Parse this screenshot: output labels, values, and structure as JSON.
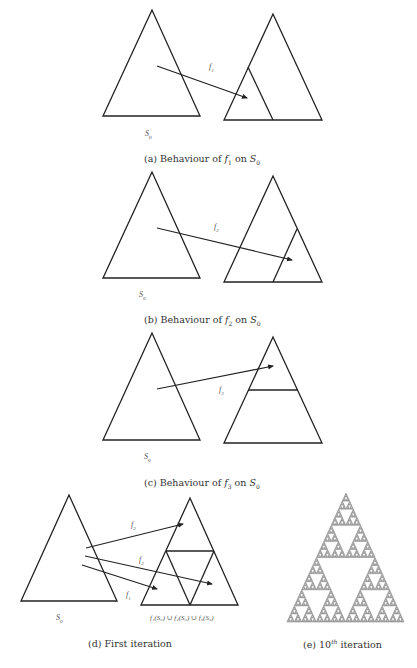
{
  "style": {
    "stroke": "#222222",
    "fractal_color": "#8a8a8a",
    "background": "#ffffff"
  },
  "panels": [
    {
      "id": "a",
      "caption": {
        "prefix": "(a) Behaviour of ",
        "fn": "f",
        "fn_sub": "1",
        "mid": " on ",
        "set": "S",
        "set_sub": "0",
        "x": 144,
        "y": 153
      },
      "source": {
        "apex": [
          152,
          10
        ],
        "left": [
          103,
          116
        ],
        "right": [
          200,
          116
        ]
      },
      "source_label": {
        "text": "S",
        "sub": "0",
        "x": 145,
        "y": 129
      },
      "target": {
        "apex": [
          273,
          14
        ],
        "left": [
          224,
          120
        ],
        "right": [
          322,
          120
        ]
      },
      "inner_lines": [
        [
          [
            248,
            67
          ],
          [
            273,
            120
          ]
        ]
      ],
      "arrows": [
        {
          "from": [
            157,
            66
          ],
          "to": [
            247,
            98
          ]
        }
      ],
      "map_labels": [
        {
          "text": "f",
          "sub": "1",
          "x": 209,
          "y": 62
        }
      ]
    },
    {
      "id": "b",
      "caption": {
        "prefix": "(b) Behaviour of ",
        "fn": "f",
        "fn_sub": "2",
        "mid": " on ",
        "set": "S",
        "set_sub": "0",
        "x": 144,
        "y": 314
      },
      "source": {
        "apex": [
          152,
          172
        ],
        "left": [
          103,
          278
        ],
        "right": [
          200,
          278
        ]
      },
      "source_label": {
        "text": "S",
        "sub": "0",
        "x": 139,
        "y": 290
      },
      "target": {
        "apex": [
          273,
          176
        ],
        "left": [
          224,
          282
        ],
        "right": [
          322,
          282
        ]
      },
      "inner_lines": [
        [
          [
            297,
            229
          ],
          [
            273,
            282
          ]
        ]
      ],
      "arrows": [
        {
          "from": [
            157,
            228
          ],
          "to": [
            292,
            260
          ]
        }
      ],
      "map_labels": [
        {
          "text": "f",
          "sub": "2",
          "x": 214,
          "y": 222
        }
      ]
    },
    {
      "id": "c",
      "caption": {
        "prefix": "(c) Behaviour of ",
        "fn": "f",
        "fn_sub": "3",
        "mid": " on ",
        "set": "S",
        "set_sub": "0",
        "x": 144,
        "y": 477
      },
      "source": {
        "apex": [
          152,
          333
        ],
        "left": [
          103,
          440
        ],
        "right": [
          200,
          440
        ]
      },
      "source_label": {
        "text": "S",
        "sub": "0",
        "x": 144,
        "y": 452
      },
      "target": {
        "apex": [
          273,
          337
        ],
        "left": [
          224,
          443
        ],
        "right": [
          322,
          443
        ]
      },
      "inner_lines": [
        [
          [
            248,
            390
          ],
          [
            298,
            390
          ]
        ]
      ],
      "arrows": [
        {
          "from": [
            157,
            389
          ],
          "to": [
            273,
            366
          ]
        }
      ],
      "map_labels": [
        {
          "text": "f",
          "sub": "3",
          "x": 219,
          "y": 385
        }
      ]
    },
    {
      "id": "d",
      "caption": {
        "prefix": "(d) First iteration",
        "x": 88,
        "y": 638
      },
      "source": {
        "apex": [
          69,
          495
        ],
        "left": [
          21,
          601
        ],
        "right": [
          117,
          601
        ]
      },
      "source_label": {
        "text": "S",
        "sub": "0",
        "x": 56,
        "y": 613
      },
      "target": {
        "apex": [
          190,
          498
        ],
        "left": [
          141,
          605
        ],
        "right": [
          238,
          605
        ]
      },
      "inner_lines": [
        [
          [
            166,
            551
          ],
          [
            214,
            551
          ]
        ],
        [
          [
            166,
            551
          ],
          [
            190,
            605
          ]
        ],
        [
          [
            214,
            551
          ],
          [
            190,
            605
          ]
        ]
      ],
      "arrows": [
        {
          "from": [
            86,
            548
          ],
          "to": [
            183,
            524
          ]
        },
        {
          "from": [
            85,
            556
          ],
          "to": [
            212,
            584
          ]
        },
        {
          "from": [
            82,
            565
          ],
          "to": [
            157,
            589
          ]
        }
      ],
      "map_labels": [
        {
          "text": "f",
          "sub": "3",
          "x": 131,
          "y": 520
        },
        {
          "text": "f",
          "sub": "2",
          "x": 139,
          "y": 555
        },
        {
          "text": "f",
          "sub": "1",
          "x": 126,
          "y": 590
        }
      ],
      "union_label": {
        "text": "f₁(S₀) ∪ f₂(S₀) ∪ f₃(S₀)",
        "x": 150,
        "y": 614
      }
    }
  ],
  "fractal": {
    "id": "e",
    "caption": {
      "prefix": "(e) ",
      "num": "10",
      "sup": "th",
      "suffix": " iteration",
      "x": 303,
      "y": 638
    },
    "apex": [
      346,
      493
    ],
    "left": [
      287,
      622
    ],
    "right": [
      404,
      622
    ],
    "depth": 7
  }
}
